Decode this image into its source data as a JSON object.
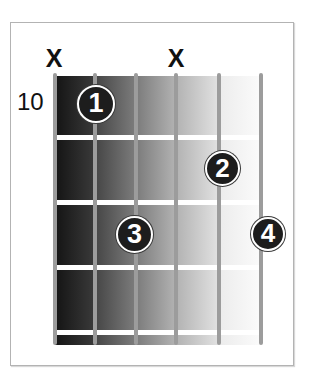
{
  "chord_diagram": {
    "start_fret_label": "10",
    "strings": 6,
    "frets_shown": 4,
    "muted_strings": [
      {
        "string": 1,
        "symbol": "X"
      },
      {
        "string": 4,
        "symbol": "X"
      }
    ],
    "fingers": [
      {
        "number": "1",
        "string": 2,
        "fret": 1
      },
      {
        "number": "2",
        "string": 5,
        "fret": 2
      },
      {
        "number": "3",
        "string": 3,
        "fret": 3
      },
      {
        "number": "4",
        "string": 6,
        "fret": 3
      }
    ],
    "colors": {
      "finger_fill": "#1d1d1d",
      "finger_ring": "#ffffff",
      "string": "#9c9c9c",
      "fret": "#ffffff",
      "frame": "#b3b3b3"
    }
  }
}
